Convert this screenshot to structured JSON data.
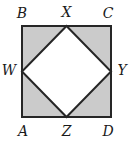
{
  "figure": {
    "background_color": "#ffffff",
    "outer_square": {
      "name": "ABCD",
      "fill_color": "#cbcbcb",
      "stroke_color": "#262626",
      "stroke_width": 2,
      "x": 22,
      "y": 26,
      "width": 89,
      "height": 91
    },
    "inner_square": {
      "name": "WXYZ",
      "fill_color": "#ffffff",
      "stroke_color": "#262626",
      "stroke_width": 2,
      "points": "66.5,26 111,71.5 66.5,117 22,71.5"
    },
    "labels": [
      {
        "id": "B",
        "text": "B",
        "position": "top-left"
      },
      {
        "id": "X",
        "text": "X",
        "position": "top-middle"
      },
      {
        "id": "C",
        "text": "C",
        "position": "top-right"
      },
      {
        "id": "W",
        "text": "W",
        "position": "left-middle"
      },
      {
        "id": "Y",
        "text": "Y",
        "position": "right-middle"
      },
      {
        "id": "A",
        "text": "A",
        "position": "bottom-left"
      },
      {
        "id": "Z",
        "text": "Z",
        "position": "bottom-middle"
      },
      {
        "id": "D",
        "text": "D",
        "position": "bottom-right"
      }
    ]
  }
}
